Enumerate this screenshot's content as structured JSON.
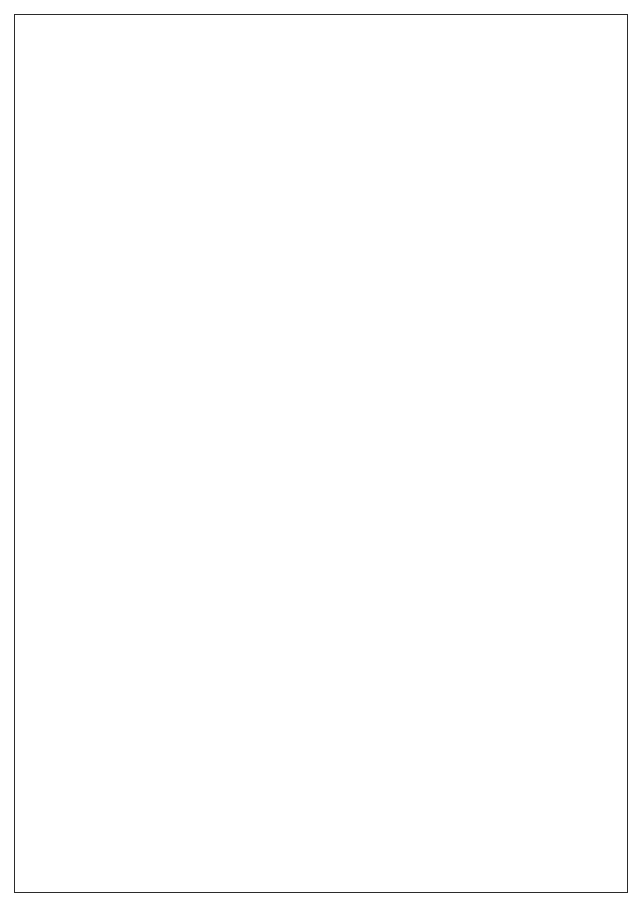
{
  "page": {
    "folio": "122",
    "orientation": "landscape-rotated",
    "border_color": "#2b2b2b",
    "rule_color": "#3a3a3a",
    "background": "#ffffff"
  },
  "worksheet": {
    "stub_header": "Product Lines",
    "columns": [
      {
        "label": "Frequency of\nPurchase"
      },
      {
        "label": "Competitive Brands\nPurchased"
      },
      {
        "label": "Method of\nPayment"
      },
      {
        "label": "Other"
      },
      {
        "label": "Other"
      },
      {
        "label": "Other"
      }
    ],
    "rows": [
      {
        "number": "1."
      },
      {
        "number": "2."
      },
      {
        "number": "3."
      },
      {
        "number": "4."
      },
      {
        "number": "5."
      },
      {
        "number": "6."
      },
      {
        "number": "7."
      },
      {
        "number": "8."
      },
      {
        "number": "9."
      },
      {
        "number": "10."
      }
    ],
    "cells": [
      [
        "",
        "",
        "",
        "",
        "",
        ""
      ],
      [
        "",
        "",
        "",
        "",
        "",
        ""
      ],
      [
        "",
        "",
        "",
        "",
        "",
        ""
      ],
      [
        "",
        "",
        "",
        "",
        "",
        ""
      ],
      [
        "",
        "",
        "",
        "",
        "",
        ""
      ],
      [
        "",
        "",
        "",
        "",
        "",
        ""
      ],
      [
        "",
        "",
        "",
        "",
        "",
        ""
      ],
      [
        "",
        "",
        "",
        "",
        "",
        ""
      ],
      [
        "",
        "",
        "",
        "",
        "",
        ""
      ],
      [
        "",
        "",
        "",
        "",
        "",
        ""
      ]
    ]
  }
}
